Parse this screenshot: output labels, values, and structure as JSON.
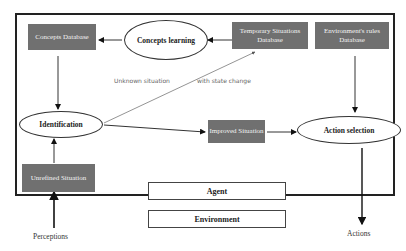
{
  "diagram": {
    "type": "agent-architecture",
    "frame_label": "Agent",
    "outside_label": "Environment",
    "nodes": {
      "concepts_database": "Concepts Database",
      "concepts_learning": "Concepts learning",
      "temporary_situations_database": "Temporary Situations Database",
      "environment_rules_database": "Environment's rules Database",
      "identification": "Identification",
      "improved_situation": "Improved Situation",
      "action_selection": "Action selection",
      "unrefined_situation": "Unrefined Situation"
    },
    "edge_labels": {
      "unknown_situation": "Unknown situation",
      "with_state_change": "with state change"
    },
    "io": {
      "perceptions": "Perceptions",
      "actions": "Actions"
    },
    "edges": [
      {
        "from": "Concepts learning",
        "to": "Concepts Database"
      },
      {
        "from": "Temporary Situations Database",
        "to": "Concepts learning"
      },
      {
        "from": "Concepts Database",
        "to": "Identification"
      },
      {
        "from": "Unrefined Situation",
        "to": "Identification"
      },
      {
        "from": "Identification",
        "to": "Temporary Situations Database",
        "label": "Unknown situation with state change"
      },
      {
        "from": "Identification",
        "to": "Improved Situation"
      },
      {
        "from": "Improved Situation",
        "to": "Action selection"
      },
      {
        "from": "Environment's rules Database",
        "to": "Action selection"
      },
      {
        "from": "Perceptions",
        "to": "Unrefined Situation"
      },
      {
        "from": "Action selection",
        "to": "Actions"
      }
    ],
    "colors": {
      "db_box": "#707070",
      "db_text": "#f4f4f4",
      "frame": "#222222",
      "note_text": "#666666"
    }
  }
}
